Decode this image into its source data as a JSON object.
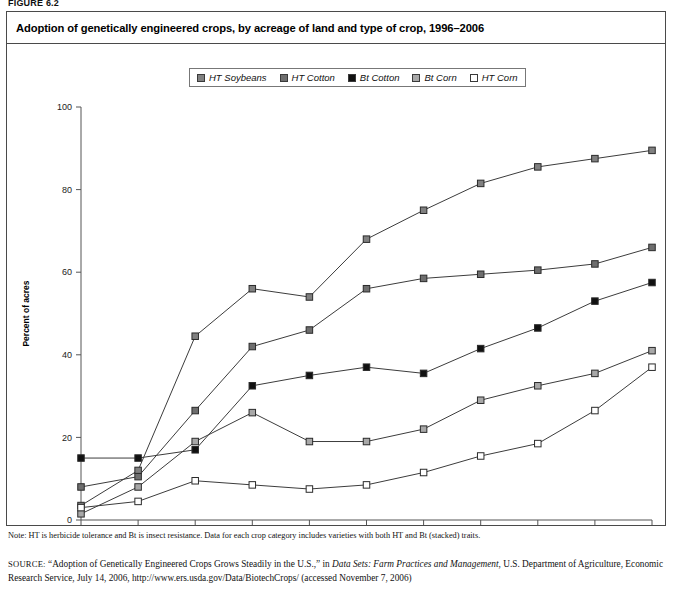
{
  "figure": {
    "label": "FIGURE 6.2",
    "title": "Adoption of genetically engineered crops, by acreage of land and type of crop, 1996–2006",
    "note": "Note: HT is herbicide tolerance and Bt is insect resistance. Data for each crop category includes varieties with both HT and Bt (stacked) traits.",
    "source_label": "SOURCE:",
    "source_part1": "“Adoption of Genetically Engineered Crops Grows Steadily in the U.S.,” in ",
    "source_italic1": "Data Sets: Farm Practices and Management",
    "source_part2": ", U.S. Department of Agriculture, Economic Research Service, July 14, 2006, http://www.ers.usda.gov/Data/BiotechCrops/ (accessed November 7, 2006)"
  },
  "chart_data": {
    "type": "line",
    "title": "Adoption of genetically engineered crops, by acreage of land and type of crop, 1996–2006",
    "xlabel": "",
    "ylabel": "Percent of acres",
    "x": [
      1996,
      1997,
      1998,
      1999,
      2000,
      2001,
      2002,
      2003,
      2004,
      2005,
      2006
    ],
    "xtick_labels": [
      "1996",
      "1997",
      "1998",
      "1999",
      "2000",
      "2001",
      "2002",
      "2003",
      "2004",
      "2005",
      "2006"
    ],
    "ytick_labels": [
      "0",
      "20",
      "40",
      "60",
      "80",
      "100"
    ],
    "yticks": [
      0,
      20,
      40,
      60,
      80,
      100
    ],
    "ylim": [
      0,
      100
    ],
    "xlim": [
      1996,
      2006
    ],
    "grid": false,
    "legend_position": "top-center",
    "series": [
      {
        "name": "HT Soybeans",
        "color": "#808080",
        "marker": "square-filled-gray",
        "values": [
          3.5,
          12,
          44.5,
          56,
          54,
          68,
          75,
          81.5,
          85.5,
          87.5,
          89.5
        ]
      },
      {
        "name": "HT Cotton",
        "color": "#6e6e6e",
        "marker": "square-filled-darkgray",
        "values": [
          8,
          10.5,
          26.5,
          42,
          46,
          56,
          58.5,
          59.5,
          60.5,
          62,
          66
        ]
      },
      {
        "name": "Bt Cotton",
        "color": "#111111",
        "marker": "square-filled-black",
        "values": [
          15,
          15,
          17,
          32.5,
          35,
          37,
          35.5,
          41.5,
          46.5,
          53,
          57.5
        ]
      },
      {
        "name": "Bt Corn",
        "color": "#a8a8a8",
        "marker": "square-filled-lightgray",
        "values": [
          1.5,
          8,
          19,
          26,
          19,
          19,
          22,
          29,
          32.5,
          35.5,
          41
        ]
      },
      {
        "name": "HT Corn",
        "color": "#ffffff",
        "marker": "square-open",
        "values": [
          3,
          4.5,
          9.5,
          8.5,
          7.5,
          8.5,
          11.5,
          15.5,
          18.5,
          26.5,
          37
        ]
      }
    ]
  }
}
